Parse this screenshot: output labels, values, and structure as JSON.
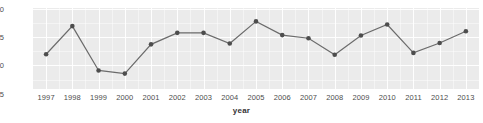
{
  "chart_data": {
    "type": "line",
    "title": "",
    "subtitle": "",
    "xlabel": "year",
    "ylabel": "",
    "categories": [
      "1997",
      "1998",
      "1999",
      "2000",
      "2001",
      "2002",
      "2003",
      "2004",
      "2005",
      "2006",
      "2007",
      "2008",
      "2009",
      "2010",
      "2011",
      "2012",
      "2013"
    ],
    "x": [
      1997,
      1998,
      1999,
      2000,
      2001,
      2002,
      2003,
      2004,
      2005,
      2006,
      2007,
      2008,
      2009,
      2010,
      2011,
      2012,
      2013
    ],
    "values": [
      14.4,
      14.525,
      14.328,
      14.314,
      14.444,
      14.495,
      14.495,
      14.448,
      14.546,
      14.485,
      14.471,
      14.398,
      14.483,
      14.532,
      14.406,
      14.45,
      14.502
    ],
    "series": [
      {
        "name": "",
        "values": [
          14.4,
          14.525,
          14.328,
          14.314,
          14.444,
          14.495,
          14.495,
          14.448,
          14.546,
          14.485,
          14.471,
          14.398,
          14.483,
          14.532,
          14.406,
          14.45,
          14.502
        ]
      }
    ],
    "ytick_labels": [
      "14.600",
      "14.475",
      "14.350",
      "14.225"
    ],
    "ytick_values": [
      14.6,
      14.475,
      14.35,
      14.225
    ],
    "ylim": [
      14.2455,
      14.6055
    ],
    "xlim": [
      1996.5,
      2013.5
    ],
    "grid": true,
    "legend": "none",
    "marker": "circle",
    "line_color": "#6b6b6b",
    "marker_color": "#4d4d4d",
    "panel_background": "#ebebeb",
    "grid_color": "#ffffff",
    "page_background": "#ffffff",
    "text_color": "#4d4d4d"
  }
}
